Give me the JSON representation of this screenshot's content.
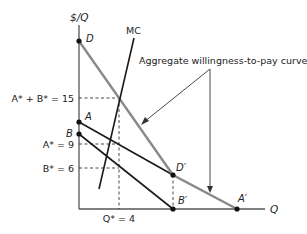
{
  "diagram": {
    "axes": {
      "y_label": "$/Q",
      "x_label": "Q"
    },
    "curves": {
      "mc_label": "MC",
      "aggregate_label": "Aggregate willingness-to-pay curve"
    },
    "points": {
      "D": "D",
      "A": "A",
      "B": "B",
      "D_prime": "D′",
      "B_prime": "B′",
      "A_prime": "A′"
    },
    "ticks": {
      "sum": "A* + B* = 15",
      "a_star": "A* = 9",
      "b_star": "B* = 6",
      "q_star": "Q* = 4"
    },
    "colors": {
      "aggregate_curve": "#8a8a8a",
      "individual_curves": "#1a1a1a",
      "axes": "#555555"
    }
  }
}
